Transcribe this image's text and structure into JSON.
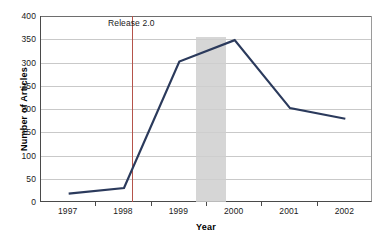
{
  "chart_data": {
    "type": "line",
    "title": "",
    "xlabel": "Year",
    "ylabel": "Number of Articles",
    "categories": [
      "1997",
      "1998",
      "1999",
      "2000",
      "2001",
      "2002"
    ],
    "values": [
      18,
      30,
      302,
      348,
      202,
      179
    ],
    "series": [
      {
        "name": "Number of Articles",
        "values": [
          18,
          30,
          302,
          348,
          202,
          179
        ],
        "color": "#2b3a5c"
      }
    ],
    "ylim": [
      0,
      400
    ],
    "yticks": [
      0,
      50,
      100,
      150,
      200,
      250,
      300,
      350,
      400
    ],
    "ytick_labels": [
      "0",
      "50",
      "100",
      "150",
      "200",
      "250",
      "300",
      "350",
      "400"
    ],
    "grid": true,
    "grid_color": "#c9c9c9",
    "legend": "none",
    "annotations": [
      {
        "label": "Release 2.0",
        "type": "vertical-line",
        "x_value": 1998.15,
        "color": "#b5534a"
      }
    ],
    "shaded_regions": [
      {
        "label": "",
        "x_start": 1999.3,
        "x_end": 1999.85,
        "y_top": 355,
        "y_bottom": 0,
        "color": "#cfcfcf"
      }
    ],
    "background_color": "#ffffff",
    "axis_color": "#4a4a4a"
  }
}
